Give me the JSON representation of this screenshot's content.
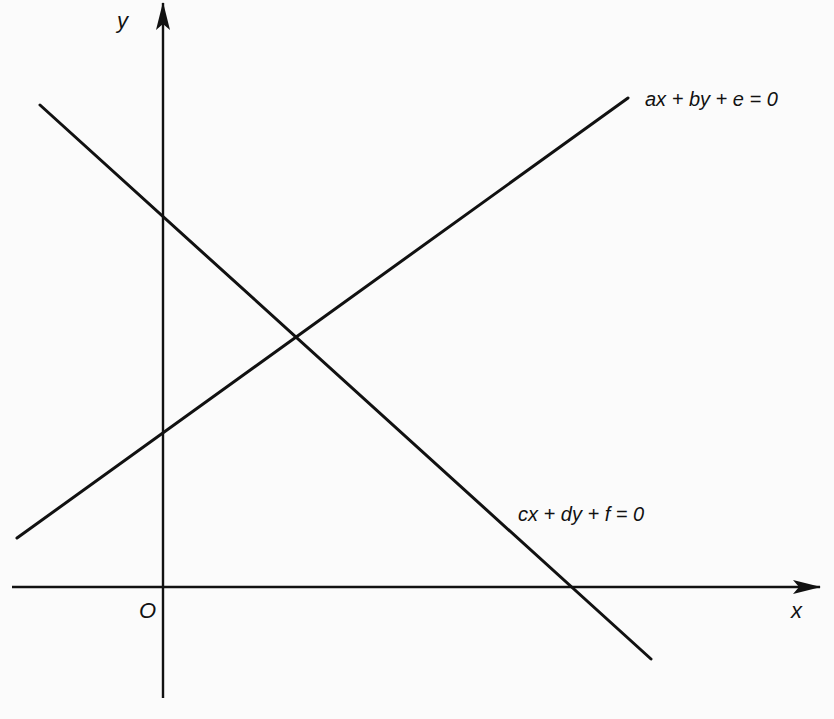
{
  "figure": {
    "type": "diagram",
    "axes": {
      "x_label": "x",
      "y_label": "y",
      "origin_label": "O"
    },
    "lines": [
      {
        "id": "line1",
        "equation": "ax + by + e = 0",
        "slope_sign": "positive",
        "y_intercept_sign": "negative-in-screen / above origin"
      },
      {
        "id": "line2",
        "equation": "cx + dy + f = 0",
        "slope_sign": "negative",
        "x_intercept_sign": "positive"
      }
    ],
    "intersection": "single point (unique solution)"
  },
  "labels": {
    "line1": "ax + by + e = 0",
    "line2": "cx + dy + f = 0",
    "x_axis": "x",
    "y_axis": "y",
    "origin": "O"
  },
  "colors": {
    "ink": "#111111",
    "paper": "#fbfbfb",
    "bleed_through": "#ececec"
  }
}
